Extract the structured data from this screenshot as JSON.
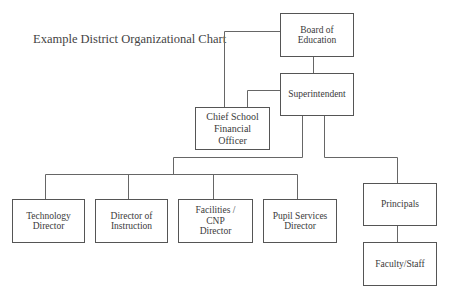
{
  "title": "Example District Organizational Chart",
  "nodes": {
    "board": "Board of\nEducation",
    "superintendent": "Superintendent",
    "cfo": "Chief School\nFinancial\nOfficer",
    "technology": "Technology\nDirector",
    "instruction": "Director of\nInstruction",
    "facilities": "Facilities /\nCNP\nDirector",
    "pupil": "Pupil Services\nDirector",
    "principals": "Principals",
    "faculty": "Faculty/Staff"
  },
  "colors": {
    "border": "#555555",
    "line": "#666666",
    "text": "#3a3a3a",
    "background": "#ffffff"
  }
}
